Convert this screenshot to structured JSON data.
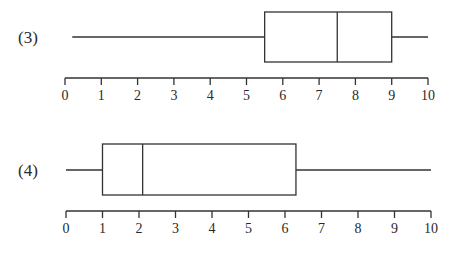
{
  "chart_data": [
    {
      "type": "boxplot",
      "label": "(3)",
      "xlim": [
        0,
        10
      ],
      "ticks": [
        "0",
        "1",
        "2",
        "3",
        "4",
        "5",
        "6",
        "7",
        "8",
        "9",
        "10"
      ],
      "min": 0.2,
      "q1": 5.5,
      "median": 7.5,
      "q3": 9,
      "max": 10
    },
    {
      "type": "boxplot",
      "label": "(4)",
      "xlim": [
        0,
        10
      ],
      "ticks": [
        "0",
        "1",
        "2",
        "3",
        "4",
        "5",
        "6",
        "7",
        "8",
        "9",
        "10"
      ],
      "min": 0,
      "q1": 1,
      "median": 2.1,
      "q3": 6.3,
      "max": 10
    }
  ],
  "layout": {
    "plots": [
      {
        "axis_y": 78,
        "x0": 65,
        "x10": 428,
        "box_top": 12,
        "box_bottom": 62,
        "whisker_y": 37,
        "label_x": 18,
        "label_y": 43
      },
      {
        "axis_y": 211,
        "x0": 66,
        "x10": 431,
        "box_top": 144,
        "box_bottom": 195,
        "whisker_y": 170,
        "label_x": 18,
        "label_y": 176
      }
    ],
    "stroke": "#333333"
  }
}
